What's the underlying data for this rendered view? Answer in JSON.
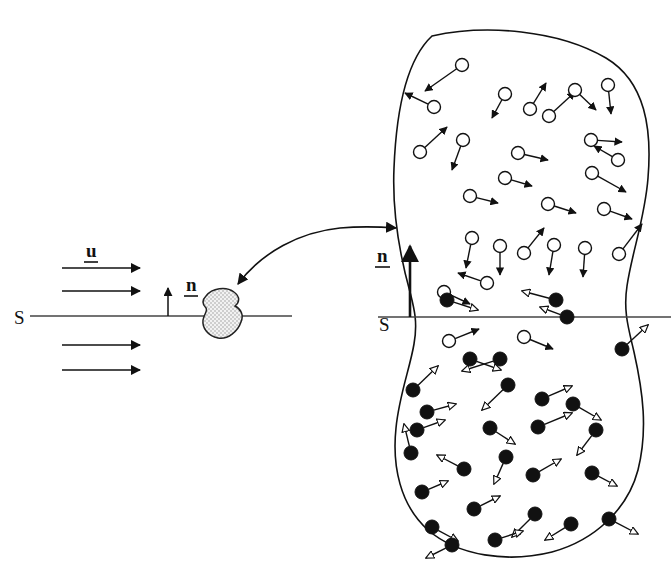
{
  "figure": {
    "background_color": "#ffffff",
    "ink_color": "#111111",
    "stipple_fill": "#d9d9d9",
    "width": 671,
    "height": 569
  },
  "labels": {
    "surface_left": "S",
    "surface_right": "S",
    "velocity": "u",
    "normal_left": "n",
    "normal_right": "n"
  },
  "left_panel": {
    "surface_line": {
      "x1": 30,
      "y1": 316,
      "x2": 292,
      "y2": 316
    },
    "surface_label": {
      "text": "S",
      "x": 22,
      "y": 323
    },
    "velocity_label": {
      "text": "u",
      "x": 88,
      "y": 258,
      "underlined": true
    },
    "normal_label": {
      "text": "n",
      "x": 190,
      "y": 287,
      "underlined": true
    },
    "normal_arrow": {
      "x": 168,
      "y_base": 316,
      "y_tip": 286
    },
    "flow_arrows": [
      {
        "x1": 62,
        "y": 268,
        "x2": 143
      },
      {
        "x1": 62,
        "y": 291,
        "x2": 143
      },
      {
        "x1": 62,
        "y": 345,
        "x2": 143
      },
      {
        "x1": 62,
        "y": 370,
        "x2": 143
      }
    ],
    "blob": {
      "cx": 221,
      "cy": 315,
      "rx": 22,
      "ry": 26,
      "fill": "stipple"
    }
  },
  "link_arrow": {
    "description": "double-headed curved magnification arrow",
    "from": {
      "x": 232,
      "y": 282
    },
    "to": {
      "x": 400,
      "y": 227
    },
    "double_headed": true
  },
  "right_panel": {
    "surface_line": {
      "x1": 378,
      "y1": 317,
      "x2": 671,
      "y2": 317
    },
    "surface_label": {
      "text": "S",
      "x": 382,
      "y": 328
    },
    "normal_label": {
      "text": "n",
      "x": 379,
      "y": 258,
      "underlined": true
    },
    "normal_arrow": {
      "x": 410,
      "y_base": 317,
      "y_tip": 243
    },
    "outline_note": "closed irregular magnified control volume with a waist at S",
    "open_particles": [
      {
        "cx": 462,
        "cy": 65,
        "ax": 425,
        "ay": 91
      },
      {
        "cx": 505,
        "cy": 94,
        "ax": 492,
        "ay": 118
      },
      {
        "cx": 434,
        "cy": 107,
        "ax": 405,
        "ay": 93
      },
      {
        "cx": 549,
        "cy": 116,
        "ax": 575,
        "ay": 92
      },
      {
        "cx": 530,
        "cy": 109,
        "ax": 546,
        "ay": 83
      },
      {
        "cx": 575,
        "cy": 90,
        "ax": 596,
        "ay": 110
      },
      {
        "cx": 608,
        "cy": 85,
        "ax": 611,
        "ay": 114
      },
      {
        "cx": 420,
        "cy": 152,
        "ax": 447,
        "ay": 127
      },
      {
        "cx": 463,
        "cy": 140,
        "ax": 452,
        "ay": 170
      },
      {
        "cx": 518,
        "cy": 153,
        "ax": 548,
        "ay": 160
      },
      {
        "cx": 591,
        "cy": 140,
        "ax": 622,
        "ay": 142
      },
      {
        "cx": 618,
        "cy": 160,
        "ax": 594,
        "ay": 146
      },
      {
        "cx": 505,
        "cy": 178,
        "ax": 532,
        "ay": 186
      },
      {
        "cx": 592,
        "cy": 173,
        "ax": 626,
        "ay": 192
      },
      {
        "cx": 470,
        "cy": 196,
        "ax": 498,
        "ay": 203
      },
      {
        "cx": 548,
        "cy": 204,
        "ax": 576,
        "ay": 213
      },
      {
        "cx": 604,
        "cy": 209,
        "ax": 632,
        "ay": 219
      },
      {
        "cx": 472,
        "cy": 238,
        "ax": 466,
        "ay": 268
      },
      {
        "cx": 500,
        "cy": 246,
        "ax": 500,
        "ay": 275
      },
      {
        "cx": 524,
        "cy": 253,
        "ax": 544,
        "ay": 228
      },
      {
        "cx": 554,
        "cy": 245,
        "ax": 549,
        "ay": 275
      },
      {
        "cx": 585,
        "cy": 248,
        "ax": 583,
        "ay": 277
      },
      {
        "cx": 619,
        "cy": 254,
        "ax": 642,
        "ay": 224
      },
      {
        "cx": 487,
        "cy": 283,
        "ax": 458,
        "ay": 273
      },
      {
        "cx": 449,
        "cy": 341,
        "ax": 479,
        "ay": 329
      },
      {
        "cx": 524,
        "cy": 337,
        "ax": 553,
        "ay": 349
      },
      {
        "cx": 444,
        "cy": 292,
        "ax": 470,
        "ay": 304
      }
    ],
    "filled_particles": [
      {
        "cx": 447,
        "cy": 300,
        "ax": 478,
        "ay": 310
      },
      {
        "cx": 556,
        "cy": 300,
        "ax": 522,
        "ay": 291
      },
      {
        "cx": 567,
        "cy": 317,
        "ax": 540,
        "ay": 307
      },
      {
        "cx": 622,
        "cy": 349,
        "ax": 648,
        "ay": 325
      },
      {
        "cx": 470,
        "cy": 359,
        "ax": 501,
        "ay": 370
      },
      {
        "cx": 413,
        "cy": 390,
        "ax": 438,
        "ay": 366
      },
      {
        "cx": 500,
        "cy": 359,
        "ax": 462,
        "ay": 371
      },
      {
        "cx": 427,
        "cy": 412,
        "ax": 456,
        "ay": 404
      },
      {
        "cx": 508,
        "cy": 385,
        "ax": 482,
        "ay": 410
      },
      {
        "cx": 542,
        "cy": 399,
        "ax": 572,
        "ay": 386
      },
      {
        "cx": 573,
        "cy": 404,
        "ax": 601,
        "ay": 420
      },
      {
        "cx": 417,
        "cy": 430,
        "ax": 445,
        "ay": 420
      },
      {
        "cx": 490,
        "cy": 428,
        "ax": 515,
        "ay": 444
      },
      {
        "cx": 538,
        "cy": 427,
        "ax": 572,
        "ay": 413
      },
      {
        "cx": 596,
        "cy": 430,
        "ax": 577,
        "ay": 455
      },
      {
        "cx": 411,
        "cy": 453,
        "ax": 404,
        "ay": 424
      },
      {
        "cx": 464,
        "cy": 469,
        "ax": 437,
        "ay": 455
      },
      {
        "cx": 506,
        "cy": 457,
        "ax": 494,
        "ay": 484
      },
      {
        "cx": 422,
        "cy": 492,
        "ax": 448,
        "ay": 481
      },
      {
        "cx": 533,
        "cy": 475,
        "ax": 561,
        "ay": 459
      },
      {
        "cx": 592,
        "cy": 473,
        "ax": 617,
        "ay": 486
      },
      {
        "cx": 474,
        "cy": 509,
        "ax": 500,
        "ay": 496
      },
      {
        "cx": 535,
        "cy": 514,
        "ax": 512,
        "ay": 537
      },
      {
        "cx": 432,
        "cy": 527,
        "ax": 458,
        "ay": 541
      },
      {
        "cx": 571,
        "cy": 524,
        "ax": 545,
        "ay": 540
      },
      {
        "cx": 495,
        "cy": 540,
        "ax": 523,
        "ay": 531
      },
      {
        "cx": 609,
        "cy": 519,
        "ax": 638,
        "ay": 534
      },
      {
        "cx": 452,
        "cy": 545,
        "ax": 426,
        "ay": 558
      }
    ]
  }
}
